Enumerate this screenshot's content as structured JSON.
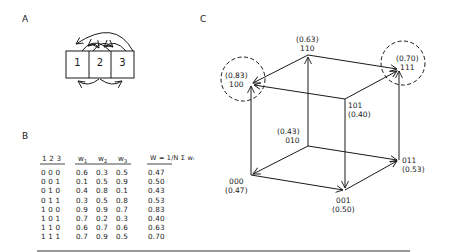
{
  "panels": {
    "a": {
      "label": "A",
      "boxes": [
        "1",
        "2",
        "3"
      ]
    },
    "b": {
      "label": "B",
      "headers": {
        "state": "1 2 3",
        "w1": "w",
        "w1_sub": "1",
        "w2": "w",
        "w2_sub": "2",
        "w3": "w",
        "w3_sub": "3",
        "W": "W = 1/N Σ wᵢ"
      },
      "rows": [
        {
          "state": "0 0 0",
          "w1": "0.6",
          "w2": "0.3",
          "w3": "0.5",
          "W": "0.47"
        },
        {
          "state": "0 0 1",
          "w1": "0.1",
          "w2": "0.5",
          "w3": "0.9",
          "W": "0.50"
        },
        {
          "state": "0 1 0",
          "w1": "0.4",
          "w2": "0.8",
          "w3": "0.1",
          "W": "0.43"
        },
        {
          "state": "0 1 1",
          "w1": "0.3",
          "w2": "0.5",
          "w3": "0.8",
          "W": "0.53"
        },
        {
          "state": "1 0 0",
          "w1": "0.9",
          "w2": "0.9",
          "w3": "0.7",
          "W": "0.83"
        },
        {
          "state": "1 0 1",
          "w1": "0.7",
          "w2": "0.2",
          "w3": "0.3",
          "W": "0.40"
        },
        {
          "state": "1 1 0",
          "w1": "0.6",
          "w2": "0.7",
          "w3": "0.6",
          "W": "0.63"
        },
        {
          "state": "1 1 1",
          "w1": "0.7",
          "w2": "0.9",
          "w3": "0.5",
          "W": "0.70"
        }
      ]
    },
    "c": {
      "label": "C",
      "vertices": [
        {
          "id": "100",
          "value": "(0.83)",
          "local_max": true
        },
        {
          "id": "110",
          "value": "(0.63)",
          "local_max": false
        },
        {
          "id": "111",
          "value": "(0.70)",
          "local_max": true
        },
        {
          "id": "101",
          "value": "(0.40)",
          "local_max": false
        },
        {
          "id": "000",
          "value": "(0.47)",
          "local_max": false
        },
        {
          "id": "010",
          "value": "(0.43)",
          "local_max": false
        },
        {
          "id": "011",
          "value": "(0.53)",
          "local_max": false
        },
        {
          "id": "001",
          "value": "(0.50)",
          "local_max": false
        }
      ]
    }
  }
}
